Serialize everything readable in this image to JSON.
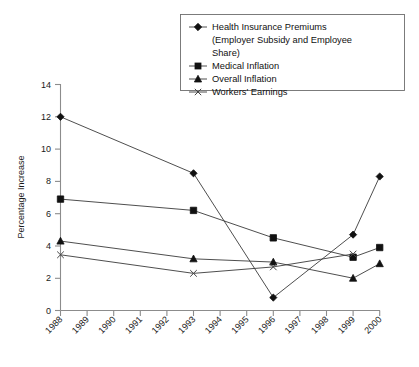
{
  "chart_data": {
    "type": "line",
    "title": "",
    "xlabel": "",
    "ylabel": "Percentage Increase",
    "ylim": [
      0,
      14
    ],
    "yticks": [
      0,
      2,
      4,
      6,
      8,
      10,
      12,
      14
    ],
    "grid": false,
    "legend_position": "top-right",
    "x": [
      1988,
      1989,
      1990,
      1991,
      1992,
      1993,
      1994,
      1995,
      1996,
      1997,
      1998,
      1999,
      2000
    ],
    "xticklabels": [
      "1988",
      "1989",
      "1990",
      "1991",
      "1992",
      "1993",
      "1994",
      "1995",
      "1996",
      "1997",
      "1998",
      "1999",
      "2000"
    ],
    "series": [
      {
        "name": "Health Insurance Premiums (Employer Subsidy and Employee Share)",
        "marker": "diamond",
        "points": [
          {
            "x": 1988,
            "y": 12.0
          },
          {
            "x": 1993,
            "y": 8.5
          },
          {
            "x": 1996,
            "y": 0.8
          },
          {
            "x": 1999,
            "y": 4.7
          },
          {
            "x": 2000,
            "y": 8.3
          }
        ]
      },
      {
        "name": "Medical Inflation",
        "marker": "square",
        "points": [
          {
            "x": 1988,
            "y": 6.9
          },
          {
            "x": 1993,
            "y": 6.2
          },
          {
            "x": 1996,
            "y": 4.5
          },
          {
            "x": 1999,
            "y": 3.3
          },
          {
            "x": 2000,
            "y": 3.9
          }
        ]
      },
      {
        "name": "Overall Inflation",
        "marker": "triangle",
        "points": [
          {
            "x": 1988,
            "y": 4.3
          },
          {
            "x": 1993,
            "y": 3.2
          },
          {
            "x": 1996,
            "y": 3.0
          },
          {
            "x": 1999,
            "y": 2.0
          },
          {
            "x": 2000,
            "y": 2.9
          }
        ]
      },
      {
        "name": "Workers' Earnings",
        "marker": "x",
        "points": [
          {
            "x": 1988,
            "y": 3.45
          },
          {
            "x": 1993,
            "y": 2.3
          },
          {
            "x": 1996,
            "y": 2.7
          },
          {
            "x": 1999,
            "y": 3.5
          }
        ]
      }
    ]
  },
  "legend": {
    "entries": [
      {
        "label_line1": "Health Insurance Premiums",
        "label_line2": "(Employer Subsidy and Employee",
        "label_line3": "Share)",
        "marker": "diamond"
      },
      {
        "label_line1": "Medical Inflation",
        "marker": "square"
      },
      {
        "label_line1": "Overall Inflation",
        "marker": "triangle"
      },
      {
        "label_line1": "Workers' Earnings",
        "marker": "x"
      }
    ]
  },
  "axis": {
    "y_title": "Percentage Increase"
  }
}
